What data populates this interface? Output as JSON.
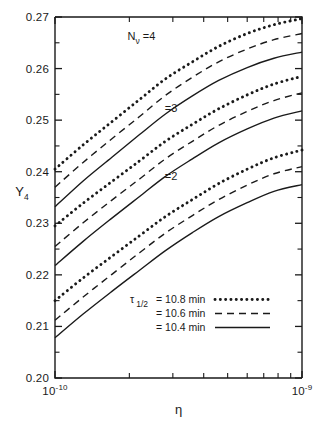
{
  "chart_data": {
    "type": "line",
    "title": "",
    "xlabel": "η",
    "ylabel": "Y₄",
    "xscale": "log",
    "xlim": [
      1e-10,
      1e-09
    ],
    "ylim": [
      0.2,
      0.27
    ],
    "grid": false,
    "legend_position": "inside-bottom-right",
    "x_tick_labels": [
      {
        "value": 1e-10,
        "mantissa": "10",
        "exponent": "-10"
      },
      {
        "value": 1e-09,
        "mantissa": "10",
        "exponent": "-9"
      }
    ],
    "x_minor_ticks": [
      2e-10,
      3e-10,
      4e-10,
      5e-10,
      6e-10,
      7e-10,
      8e-10,
      9e-10
    ],
    "y_tick_labels": [
      "0.20",
      "0.21",
      "0.22",
      "0.23",
      "0.24",
      "0.25",
      "0.26",
      "0.27"
    ],
    "y_minor_ticks": [
      0.205,
      0.215,
      0.225,
      0.235,
      0.245,
      0.255,
      0.265
    ],
    "x": [
      1e-10,
      1.3e-10,
      1.7e-10,
      2.2e-10,
      2.8e-10,
      3.6e-10,
      4.6e-10,
      6e-10,
      7.7e-10,
      1e-09
    ],
    "series": [
      {
        "name": "Nv=4, tau_1/2 = 10.8 min",
        "group": "Nν =4",
        "style": "dotted",
        "values": [
          0.2405,
          0.2452,
          0.2497,
          0.254,
          0.258,
          0.2613,
          0.2643,
          0.2668,
          0.2685,
          0.2697
        ]
      },
      {
        "name": "Nv=4, tau_1/2 = 10.6 min",
        "group": "Nν =4",
        "style": "dashed",
        "values": [
          0.237,
          0.2418,
          0.2464,
          0.2507,
          0.2548,
          0.2583,
          0.2613,
          0.2638,
          0.2656,
          0.2668
        ]
      },
      {
        "name": "Nv=4, tau_1/2 = 10.4 min",
        "group": "Nν =4",
        "style": "solid",
        "values": [
          0.2332,
          0.2382,
          0.2428,
          0.2472,
          0.2512,
          0.2547,
          0.2577,
          0.2602,
          0.262,
          0.2632
        ]
      },
      {
        "name": "Nv=3, tau_1/2 = 10.8 min",
        "group": "=3",
        "style": "dotted",
        "values": [
          0.2295,
          0.2339,
          0.2381,
          0.2421,
          0.2459,
          0.2492,
          0.2522,
          0.2549,
          0.257,
          0.2585
        ]
      },
      {
        "name": "Nv=3, tau_1/2 = 10.6 min",
        "group": "=3",
        "style": "dashed",
        "values": [
          0.2255,
          0.2301,
          0.2345,
          0.2386,
          0.2425,
          0.2459,
          0.249,
          0.2517,
          0.2538,
          0.2553
        ]
      },
      {
        "name": "Nv=3, tau_1/2 = 10.4 min",
        "group": "=3",
        "style": "solid",
        "values": [
          0.2218,
          0.2265,
          0.231,
          0.2352,
          0.2391,
          0.2425,
          0.2456,
          0.2483,
          0.2504,
          0.2518
        ]
      },
      {
        "name": "Nv=2, tau_1/2 = 10.8 min",
        "group": "=2",
        "style": "dotted",
        "values": [
          0.215,
          0.2194,
          0.2236,
          0.2276,
          0.2313,
          0.2346,
          0.2377,
          0.2405,
          0.2427,
          0.2442
        ]
      },
      {
        "name": "Nv=2, tau_1/2 = 10.6 min",
        "group": "=2",
        "style": "dashed",
        "values": [
          0.2112,
          0.2157,
          0.2201,
          0.2243,
          0.2281,
          0.2315,
          0.2346,
          0.2374,
          0.2396,
          0.241
        ]
      },
      {
        "name": "Nv=2, tau_1/2 = 10.4 min",
        "group": "=2",
        "style": "solid",
        "values": [
          0.2078,
          0.2124,
          0.2168,
          0.2209,
          0.2247,
          0.2282,
          0.2313,
          0.234,
          0.2362,
          0.2375
        ]
      }
    ],
    "annotations": [
      {
        "name": "nv4",
        "text_main": "N",
        "text_sub": "ν",
        "text_tail": " =4",
        "x_frac": 0.35,
        "y_value": 0.2655
      },
      {
        "name": "nv3",
        "text_tail": "=3",
        "x_frac": 0.47,
        "y_value": 0.2516
      },
      {
        "name": "nv2",
        "text_tail": "=2",
        "x_frac": 0.47,
        "y_value": 0.2383
      }
    ],
    "legend": {
      "symbol_main": "τ",
      "symbol_sub": "1/2",
      "entries": [
        {
          "label": "= 10.8 min",
          "style": "dotted"
        },
        {
          "label": "= 10.6 min",
          "style": "dashed"
        },
        {
          "label": "= 10.4 min",
          "style": "solid"
        }
      ]
    },
    "colors": {
      "line": "#1a1a1a",
      "axis": "#1a1a1a",
      "background": "#ffffff"
    }
  }
}
